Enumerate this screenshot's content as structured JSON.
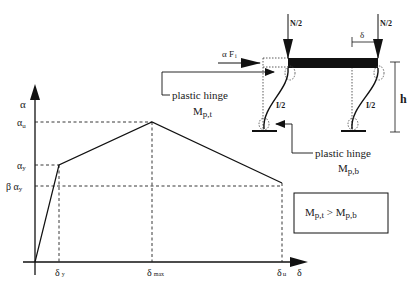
{
  "graph": {
    "y_axis_label": "α",
    "x_axis_label": "δ",
    "y_ticks": [
      {
        "label_main": "α",
        "label_sub": "u",
        "y": 122
      },
      {
        "label_main": "α",
        "label_sub": "y",
        "y": 165
      },
      {
        "label_main": "β α",
        "label_sub": "y",
        "y": 186
      }
    ],
    "x_ticks": [
      {
        "label_main": "δ",
        "label_sub": "y",
        "x": 59
      },
      {
        "label_main": "δ",
        "label_sub": "max",
        "x": 152
      },
      {
        "label_main": "δ",
        "label_sub": "u",
        "x": 282
      }
    ],
    "curve_points": [
      [
        0,
        0
      ],
      [
        "δy",
        "αy"
      ],
      [
        "δmax",
        "αu"
      ],
      [
        "δu",
        "βαy"
      ]
    ]
  },
  "frame": {
    "load_left": "N/2",
    "load_right": "N/2",
    "lateral_force_main": "α F",
    "lateral_force_sub": "i",
    "drift_label": "δ",
    "height_label": "h",
    "column_left_label": "I/2",
    "column_right_label": "I/2",
    "hinge_top_label": "plastic hinge",
    "hinge_top_moment_main": "M",
    "hinge_top_moment_sub": "p,t",
    "hinge_bottom_label": "plastic hinge",
    "hinge_bottom_moment_main": "M",
    "hinge_bottom_moment_sub": "p,b"
  },
  "condition_box": {
    "left_main": "M",
    "left_sub": "p,t",
    "operator": " > ",
    "right_main": "M",
    "right_sub": "p,b"
  }
}
